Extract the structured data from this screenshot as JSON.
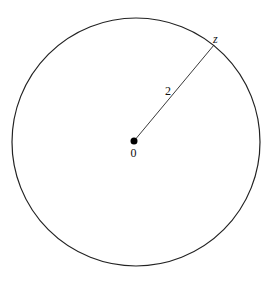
{
  "diagram": {
    "circle": {
      "cx": 136,
      "cy": 142,
      "r": 124,
      "stroke": "#222222"
    },
    "center": {
      "x": 134,
      "y": 141,
      "label": "0"
    },
    "point": {
      "x": 214,
      "y": 45,
      "label": "z"
    },
    "radius_label": "2"
  }
}
